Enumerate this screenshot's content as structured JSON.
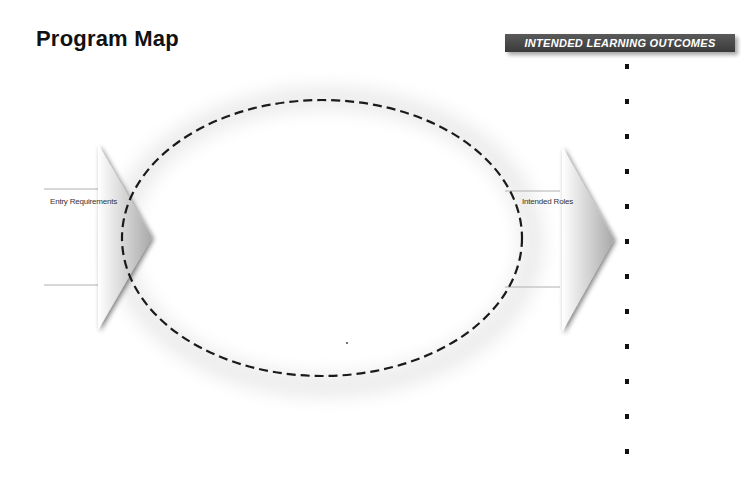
{
  "header": {
    "title": "Program Map",
    "banner": "INTENDED LEARNING OUTCOMES"
  },
  "diagram": {
    "entry_label": "Entry Requirements",
    "roles_label": "Intended Roles",
    "ellipse": {
      "cx": 322,
      "cy": 238,
      "rx": 200,
      "ry": 138,
      "style": "dashed"
    },
    "outcome_bullets": [
      {
        "y": 66
      },
      {
        "y": 101
      },
      {
        "y": 136
      },
      {
        "y": 171
      },
      {
        "y": 206
      },
      {
        "y": 241
      },
      {
        "y": 276
      },
      {
        "y": 311
      },
      {
        "y": 346
      },
      {
        "y": 381
      },
      {
        "y": 416
      },
      {
        "y": 451
      }
    ]
  },
  "colors": {
    "banner_bg": "#444444",
    "arrow_gray": "#a8a8a8",
    "line_gray": "#b0b0b0",
    "ellipse_stroke": "#1a1a1a"
  }
}
